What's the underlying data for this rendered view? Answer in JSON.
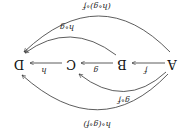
{
  "diagram": {
    "rotation_deg": 180,
    "nodes": [
      {
        "id": "A",
        "label": "A"
      },
      {
        "id": "B",
        "label": "B"
      },
      {
        "id": "C",
        "label": "C"
      },
      {
        "id": "D",
        "label": "D"
      }
    ],
    "edges": [
      {
        "from": "A",
        "to": "B",
        "label": "f"
      },
      {
        "from": "B",
        "to": "C",
        "label": "g"
      },
      {
        "from": "C",
        "to": "D",
        "label": "h"
      },
      {
        "from": "A",
        "to": "C",
        "label": "g∘f"
      },
      {
        "from": "B",
        "to": "D",
        "label": "h∘g"
      },
      {
        "from": "A",
        "to": "D",
        "label": "(h∘g)∘f"
      },
      {
        "from": "A",
        "to": "D",
        "label": "h∘(g∘f)"
      }
    ],
    "colors": {
      "stroke": "#333333",
      "text": "#111111",
      "background": "#ffffff"
    }
  }
}
